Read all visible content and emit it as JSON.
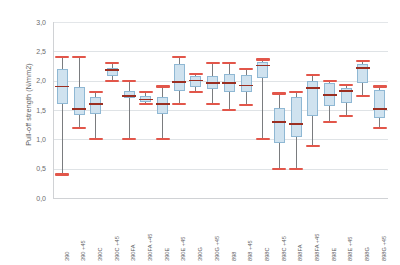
{
  "chart_data": {
    "type": "box",
    "title": "",
    "xlabel": "",
    "ylabel": "Pull-off strength (N/mm2)",
    "ylim": [
      0.0,
      3.0
    ],
    "ytick_labels": [
      "3,0",
      "2,5",
      "2,0",
      "1,5",
      "1,0",
      "0,5",
      "0,0"
    ],
    "ytick_values": [
      3.0,
      2.5,
      2.0,
      1.5,
      1.0,
      0.5,
      0.0
    ],
    "grid": true,
    "legend": "none",
    "categories": [
      "390",
      "390 +45",
      "390C",
      "390C +45",
      "390FA",
      "390FA +45",
      "390E",
      "390E +45",
      "390G",
      "390G +45",
      "898",
      "898 +45",
      "898C",
      "898C +45",
      "898FA",
      "898FA +45",
      "898E",
      "898E +45",
      "898G",
      "898G +45"
    ],
    "boxes": [
      {
        "label": "390",
        "min": 0.4,
        "q1": 1.6,
        "median": 1.9,
        "q3": 2.2,
        "max": 2.4
      },
      {
        "label": "390 +45",
        "min": 1.2,
        "q1": 1.42,
        "median": 1.52,
        "q3": 1.9,
        "max": 2.4
      },
      {
        "label": "390C",
        "min": 1.0,
        "q1": 1.44,
        "median": 1.6,
        "q3": 1.72,
        "max": 1.8
      },
      {
        "label": "390C +45",
        "min": 2.0,
        "q1": 2.08,
        "median": 2.18,
        "q3": 2.22,
        "max": 2.3
      },
      {
        "label": "390FA",
        "min": 1.0,
        "q1": 1.7,
        "median": 1.74,
        "q3": 1.82,
        "max": 2.0
      },
      {
        "label": "390FA +45",
        "min": 1.6,
        "q1": 1.64,
        "median": 1.68,
        "q3": 1.74,
        "max": 1.8
      },
      {
        "label": "390E",
        "min": 1.0,
        "q1": 1.44,
        "median": 1.6,
        "q3": 1.72,
        "max": 1.9
      },
      {
        "label": "390E +45",
        "min": 1.6,
        "q1": 1.82,
        "median": 1.98,
        "q3": 2.28,
        "max": 2.4
      },
      {
        "label": "390G",
        "min": 1.8,
        "q1": 1.9,
        "median": 2.0,
        "q3": 2.08,
        "max": 2.12
      },
      {
        "label": "390G +45",
        "min": 1.6,
        "q1": 1.86,
        "median": 1.96,
        "q3": 2.08,
        "max": 2.3
      },
      {
        "label": "898",
        "min": 1.5,
        "q1": 1.8,
        "median": 1.96,
        "q3": 2.12,
        "max": 2.3
      },
      {
        "label": "898 +45",
        "min": 1.58,
        "q1": 1.8,
        "median": 1.92,
        "q3": 2.1,
        "max": 2.2
      },
      {
        "label": "898C",
        "min": 1.0,
        "q1": 2.04,
        "median": 2.26,
        "q3": 2.32,
        "max": 2.36
      },
      {
        "label": "898C +45",
        "min": 0.5,
        "q1": 0.94,
        "median": 1.3,
        "q3": 1.54,
        "max": 1.78
      },
      {
        "label": "898FA",
        "min": 0.5,
        "q1": 1.04,
        "median": 1.26,
        "q3": 1.72,
        "max": 1.8
      },
      {
        "label": "898FA +45",
        "min": 0.88,
        "q1": 1.4,
        "median": 1.88,
        "q3": 2.0,
        "max": 2.1
      },
      {
        "label": "898E",
        "min": 1.3,
        "q1": 1.56,
        "median": 1.76,
        "q3": 1.96,
        "max": 2.0
      },
      {
        "label": "898E +45",
        "min": 1.4,
        "q1": 1.62,
        "median": 1.82,
        "q3": 1.88,
        "max": 1.92
      },
      {
        "label": "898G",
        "min": 1.74,
        "q1": 1.96,
        "median": 2.22,
        "q3": 2.28,
        "max": 2.34
      },
      {
        "label": "898G +45",
        "min": 1.2,
        "q1": 1.36,
        "median": 1.52,
        "q3": 1.84,
        "max": 1.9
      }
    ],
    "colors": {
      "box_fill": "#cfe2ef",
      "box_border": "#8fb8d4",
      "median": "#9b2f22",
      "cap": "#e2564a",
      "whisker": "#7a7c7f",
      "grid": "#dfe3e6",
      "axis": "#d0d2d5",
      "text": "#5a5b5d",
      "background": "#ffffff"
    }
  }
}
